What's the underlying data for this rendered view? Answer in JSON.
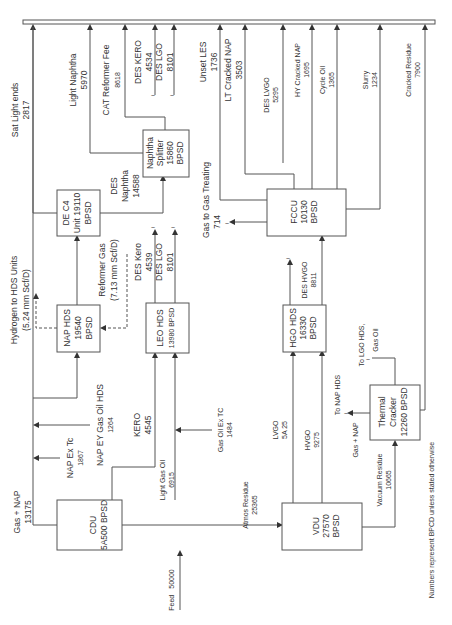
{
  "units": {
    "cdu": {
      "name": "CDU",
      "capacity": "5A500 BPSD"
    },
    "nap_hds": {
      "name": "NAP HDS",
      "capacity": "19540",
      "unit": "BPSD"
    },
    "de_c4": {
      "name": "DE C4",
      "capacity": "Unit 19110",
      "unit": "BPSD"
    },
    "naphtha_splitter": {
      "name": "Naphtha",
      "name2": "Splitter",
      "capacity": "15860",
      "unit": "BPSD"
    },
    "leo_hds": {
      "name": "LEO HDS",
      "capacity": "13980 BPSD"
    },
    "vdu": {
      "name": "VDU",
      "capacity": "27570",
      "unit": "BPSD"
    },
    "hgo_hds": {
      "name": "HGO HDS",
      "capacity": "16330",
      "unit": "BPSD"
    },
    "fccu": {
      "name": "FCCU",
      "capacity": "10130",
      "unit": "BPSD"
    },
    "thermal_cracker": {
      "name": "Thermal",
      "name2": "Cracker",
      "capacity": "12260 BPSD"
    }
  },
  "streams": {
    "feed": {
      "label": "Feed",
      "value": "50000"
    },
    "gas_nap": {
      "label": "Gas + NAP",
      "value": "13175"
    },
    "nap_ex_tc": {
      "label": "NAP Ex Tc",
      "value": "1867"
    },
    "nap_ey_gas_oil": {
      "label": "NAP EY Gas Oil HDS",
      "value": "1264"
    },
    "kero": {
      "label": "KERO",
      "value": "4545"
    },
    "light_gas_oil": {
      "label": "Light Gas Oil",
      "value": "6915"
    },
    "gas_oil_ex_tc": {
      "label": "Gas Oil Ex TC",
      "value": "1484"
    },
    "atmos_residue": {
      "label": "Atmos Residue",
      "value": "25365"
    },
    "hydrogen": {
      "label": "Hydrogen to HDS Units",
      "value": "(5.24 mm Scf/D)"
    },
    "reformer_gas": {
      "label": "Reformer Gas",
      "value": "(7.13 mm Scf/D)"
    },
    "sat_light_ends": {
      "label": "Sat Light ends",
      "value": "2817"
    },
    "des_naphtha": {
      "label": "DES",
      "label2": "Naphtha",
      "value": "14588"
    },
    "light_naphtha": {
      "label": "Light Naphtha",
      "value": "5970"
    },
    "cat_reformer_fee": {
      "label": "CAT Reformer Fee",
      "value": "8618"
    },
    "des_kero_top": {
      "label": "DES KERO",
      "value": "4534"
    },
    "des_lgo_top": {
      "label": "DES LGO",
      "value": "8101"
    },
    "des_kero": {
      "label": "DES Kero",
      "value": "4539"
    },
    "des_lgo": {
      "label": "DES LGO",
      "value": "8101"
    },
    "gas_to_treating": {
      "label": "Gas to Gas Treating",
      "value": "714"
    },
    "unset_les": {
      "label": "Unset LES",
      "value": "1736"
    },
    "lt_cracked_nap": {
      "label": "LT Cracked NAP",
      "value": "3503"
    },
    "des_lvgo": {
      "label": "DES LVGO",
      "value": "5295"
    },
    "hy_cracked_nap": {
      "label": "HY Cracked NAP",
      "value": "1695"
    },
    "cycle_oil": {
      "label": "Cycle Oil",
      "value": "1365"
    },
    "slurry": {
      "label": "Slurry",
      "value": "1234"
    },
    "cracked_residue": {
      "label": "Cracked Residue",
      "value": "7900"
    },
    "lvgo": {
      "label": "LVGO",
      "value": "5A 25"
    },
    "hvgo": {
      "label": "HVGO",
      "value": "9275"
    },
    "des_hvgo": {
      "label": "DES HVGO",
      "value": "8811"
    },
    "to_nap_hds": {
      "label": "To NAP HDS"
    },
    "tc_gas_nap": {
      "label": "Gas + NAP"
    },
    "to_lgo_hds": {
      "label": "To LGO HDS,"
    },
    "tc_gas_oil": {
      "label": "Gas Oil"
    },
    "vacuum_residue": {
      "label": "Vacuum Residue",
      "value": "10665"
    }
  },
  "footnote": "Numbers represent BPCD unless stated otherwise"
}
